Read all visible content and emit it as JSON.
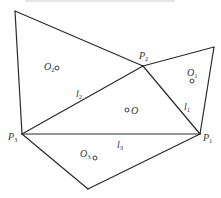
{
  "figure": {
    "type": "geometry-diagram",
    "stroke_color": "#2a2a2a",
    "background": "#ffffff",
    "vertices": {
      "top_left": [
        15,
        11
      ],
      "top_right": [
        214,
        47
      ],
      "P2": [
        143,
        66
      ],
      "P1": [
        200,
        134
      ],
      "P3": [
        22,
        134
      ],
      "bottom": [
        88,
        189
      ]
    },
    "points": [
      {
        "name": "P1",
        "base": "P",
        "sub": "1"
      },
      {
        "name": "P2",
        "base": "P",
        "sub": "2"
      },
      {
        "name": "P3",
        "base": "P",
        "sub": "3"
      }
    ],
    "centers": [
      {
        "name": "O",
        "base": "O",
        "sub": ""
      },
      {
        "name": "O1",
        "base": "O",
        "sub": "1"
      },
      {
        "name": "O2",
        "base": "O",
        "sub": "2"
      },
      {
        "name": "O3",
        "base": "O",
        "sub": "3"
      }
    ],
    "lines": [
      {
        "name": "l1",
        "base": "l",
        "sub": "1"
      },
      {
        "name": "l2",
        "base": "l",
        "sub": "2"
      },
      {
        "name": "l3",
        "base": "l",
        "sub": "3"
      }
    ]
  }
}
